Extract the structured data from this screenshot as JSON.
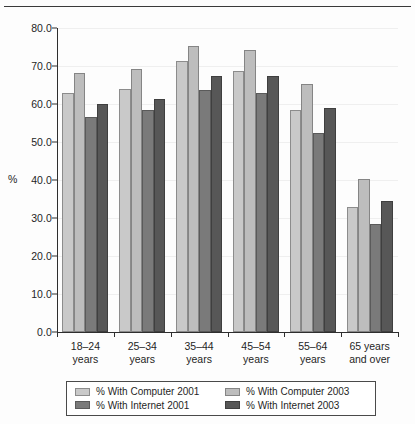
{
  "chart_data": {
    "type": "bar",
    "title": "",
    "xlabel": "",
    "ylabel": "%",
    "ylim": [
      0.0,
      80.0
    ],
    "ytick_step": 10.0,
    "yticks": [
      "0.0",
      "10.0",
      "20.0",
      "30.0",
      "40.0",
      "50.0",
      "60.0",
      "70.0",
      "80.0"
    ],
    "grid": true,
    "legend_position": "bottom",
    "categories": [
      "18–24 years",
      "25–34 years",
      "35–44 years",
      "45–54 years",
      "55–64 years",
      "65 years and over"
    ],
    "category_lines": [
      [
        "18–24",
        "years"
      ],
      [
        "25–34",
        "years"
      ],
      [
        "35–44",
        "years"
      ],
      [
        "45–54",
        "years"
      ],
      [
        "55–64",
        "years"
      ],
      [
        "65 years",
        "and over"
      ]
    ],
    "series": [
      {
        "name": "% With Computer 2001",
        "color": "#c9c9c9",
        "values": [
          63.0,
          64.0,
          71.2,
          68.8,
          58.5,
          33.0
        ]
      },
      {
        "name": "% With Computer 2003",
        "color": "#bdbdbd",
        "values": [
          68.2,
          69.2,
          75.3,
          74.2,
          65.3,
          40.2
        ]
      },
      {
        "name": "% With Internet 2001",
        "color": "#7a7a7a",
        "values": [
          56.7,
          58.3,
          63.8,
          63.0,
          52.4,
          28.4
        ]
      },
      {
        "name": "% With Internet 2003",
        "color": "#575757",
        "values": [
          60.0,
          61.3,
          67.3,
          67.3,
          59.0,
          34.4
        ]
      }
    ]
  },
  "axis": {
    "y_axis_label": "%"
  },
  "legend": {
    "entries": [
      {
        "label": "% With Computer 2001",
        "swatch": "s0"
      },
      {
        "label": "% With Computer 2003",
        "swatch": "s1"
      },
      {
        "label": "% With Internet 2001",
        "swatch": "s2"
      },
      {
        "label": "% With Internet 2003",
        "swatch": "s3"
      }
    ]
  }
}
